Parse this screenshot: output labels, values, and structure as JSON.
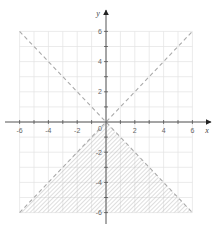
{
  "chart_data": {
    "type": "line",
    "title": "",
    "xlabel": "x",
    "ylabel": "y",
    "xlim": [
      -6,
      6
    ],
    "ylim": [
      -6,
      6
    ],
    "grid": true,
    "grid_step": 1,
    "x_ticks": [
      -6,
      -5,
      -4,
      -3,
      -2,
      -1,
      1,
      2,
      3,
      4,
      5,
      6
    ],
    "y_ticks": [
      -6,
      -5,
      -4,
      -3,
      -2,
      -1,
      1,
      2,
      3,
      4,
      5,
      6
    ],
    "x_tick_labels": [
      {
        "value": -6,
        "label": "-6"
      },
      {
        "value": -4,
        "label": "-4"
      },
      {
        "value": -2,
        "label": "-2"
      },
      {
        "value": 2,
        "label": "2"
      },
      {
        "value": 4,
        "label": "4"
      },
      {
        "value": 6,
        "label": "6"
      }
    ],
    "y_tick_labels": [
      {
        "value": 6,
        "label": "6"
      },
      {
        "value": 4,
        "label": "4"
      },
      {
        "value": 2,
        "label": "2"
      },
      {
        "value": -2,
        "label": "-2"
      },
      {
        "value": -4,
        "label": "-4"
      },
      {
        "value": -6,
        "label": "-6"
      }
    ],
    "origin_label": "0",
    "series": [
      {
        "name": "y = -x",
        "style": "dashed",
        "points": [
          [
            -6,
            6
          ],
          [
            6,
            -6
          ]
        ]
      },
      {
        "name": "y = x",
        "style": "dashed",
        "points": [
          [
            -6,
            -6
          ],
          [
            6,
            6
          ]
        ]
      }
    ],
    "shaded_region": {
      "description": "y < -|x|",
      "pattern": "diagonal-hatch",
      "vertices": [
        [
          0,
          0
        ],
        [
          6,
          -6
        ],
        [
          -6,
          -6
        ]
      ]
    },
    "colors": {
      "axis": "#555555",
      "grid": "#e2e2e2",
      "dashed_line": "#aaaaaa",
      "hatch": "#b5b5b5",
      "tick_label": "#666666"
    }
  }
}
